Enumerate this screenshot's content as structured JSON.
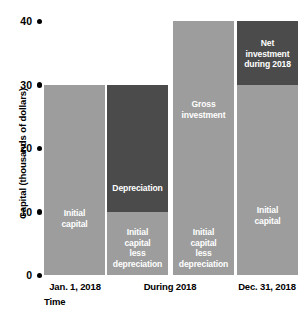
{
  "chart_data": {
    "type": "bar",
    "title": "",
    "xlabel": "Time",
    "ylabel": "Capital (thousands of dollars)",
    "ylim": [
      0,
      40
    ],
    "yticks": [
      0,
      10,
      20,
      30,
      40
    ],
    "ytick_labels": [
      "0",
      "10",
      "20",
      "30",
      "40"
    ],
    "grid": false,
    "legend": "none",
    "categories": [
      "Jan. 1, 2018",
      "During 2018",
      "Dec. 31, 2018"
    ],
    "bars": [
      {
        "id": "bar-jan-1-2018",
        "category": "Jan. 1, 2018",
        "segments": [
          {
            "id": "initial-capital",
            "label": "Initial\ncapital",
            "from": 0,
            "to": 30,
            "value": 30,
            "color": "#9d9d9d",
            "shade": "light"
          }
        ]
      },
      {
        "id": "bar-during-2018-depreciation",
        "category": "During 2018",
        "segments": [
          {
            "id": "initial-capital-less-depreciation",
            "label": "Initial\ncapital\nless\ndepreciation",
            "from": 0,
            "to": 10,
            "value": 10,
            "color": "#9d9d9d",
            "shade": "light"
          },
          {
            "id": "depreciation",
            "label": "Depreciation",
            "from": 10,
            "to": 30,
            "value": 20,
            "color": "#4b4b4b",
            "shade": "dark"
          }
        ]
      },
      {
        "id": "bar-during-2018-gross-investment",
        "category": "During 2018",
        "segments": [
          {
            "id": "initial-capital-less-depreciation-2",
            "label": "Initial\ncapital\nless\ndepreciation",
            "from": 0,
            "to": 10,
            "value": 10,
            "color": "#9d9d9d",
            "shade": "light"
          },
          {
            "id": "gross-investment",
            "label": "Gross\ninvestment",
            "from": 10,
            "to": 40,
            "value": 30,
            "color": "#9d9d9d",
            "shade": "light"
          }
        ]
      },
      {
        "id": "bar-dec-31-2018",
        "category": "Dec. 31, 2018",
        "segments": [
          {
            "id": "initial-capital-3",
            "label": "Initial\ncapital",
            "from": 0,
            "to": 30,
            "value": 30,
            "color": "#9d9d9d",
            "shade": "light"
          },
          {
            "id": "net-investment-during-2018",
            "label": "Net\ninvestment\nduring 2018",
            "from": 30,
            "to": 40,
            "value": 10,
            "color": "#4b4b4b",
            "shade": "dark"
          }
        ]
      }
    ]
  },
  "axis": {
    "y_title": "Capital (thousands of dollars)",
    "x_title": "Time",
    "ticks": [
      {
        "label": "40",
        "value": 40
      },
      {
        "label": "30",
        "value": 30
      },
      {
        "label": "20",
        "value": 20
      },
      {
        "label": "10",
        "value": 10
      },
      {
        "label": "0",
        "value": 0
      }
    ]
  },
  "x_categories": [
    {
      "label": "Jan. 1, 2018",
      "center": 75
    },
    {
      "label": "During 2018",
      "center": 170
    },
    {
      "label": "Dec. 31, 2018",
      "center": 267
    }
  ],
  "colors": {
    "light_gray": "#9d9d9d",
    "dark_gray": "#4b4b4b",
    "text_on_bar": "#ffffff",
    "axis_text": "#000000",
    "background": "#ffffff"
  }
}
